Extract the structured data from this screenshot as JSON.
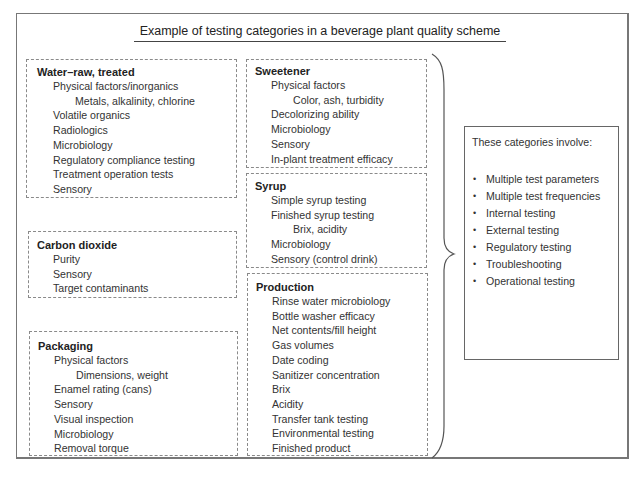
{
  "title": "Example of testing categories in a beverage plant quality scheme",
  "boxes": {
    "water": {
      "heading": "Water–raw, treated",
      "items": [
        {
          "text": "Physical factors/inorganics",
          "level": 1
        },
        {
          "text": "Metals, alkalinity, chlorine",
          "level": 2
        },
        {
          "text": "Volatile organics",
          "level": 1
        },
        {
          "text": "Radiologics",
          "level": 1
        },
        {
          "text": "Microbiology",
          "level": 1
        },
        {
          "text": "Regulatory compliance testing",
          "level": 1
        },
        {
          "text": "Treatment operation tests",
          "level": 1
        },
        {
          "text": "Sensory",
          "level": 1
        }
      ]
    },
    "carbon_dioxide": {
      "heading": "Carbon dioxide",
      "items": [
        {
          "text": "Purity",
          "level": 1
        },
        {
          "text": "Sensory",
          "level": 1
        },
        {
          "text": "Target contaminants",
          "level": 1
        }
      ]
    },
    "packaging": {
      "heading": "Packaging",
      "items": [
        {
          "text": "Physical factors",
          "level": 1
        },
        {
          "text": "Dimensions, weight",
          "level": 2
        },
        {
          "text": "Enamel rating (cans)",
          "level": 1
        },
        {
          "text": "Sensory",
          "level": 1
        },
        {
          "text": "Visual inspection",
          "level": 1
        },
        {
          "text": "Microbiology",
          "level": 1
        },
        {
          "text": "Removal torque",
          "level": 1
        }
      ]
    },
    "sweetener": {
      "heading": "Sweetener",
      "items": [
        {
          "text": "Physical factors",
          "level": 1
        },
        {
          "text": "Color, ash, turbidity",
          "level": 2
        },
        {
          "text": "Decolorizing ability",
          "level": 1
        },
        {
          "text": "Microbiology",
          "level": 1
        },
        {
          "text": "Sensory",
          "level": 1
        },
        {
          "text": "In-plant treatment efficacy",
          "level": 1
        }
      ]
    },
    "syrup": {
      "heading": "Syrup",
      "items": [
        {
          "text": "Simple syrup testing",
          "level": 1
        },
        {
          "text": "Finished syrup testing",
          "level": 1
        },
        {
          "text": "Brix, acidity",
          "level": 2
        },
        {
          "text": "Microbiology",
          "level": 1
        },
        {
          "text": "Sensory (control drink)",
          "level": 1
        }
      ]
    },
    "production": {
      "heading": "Production",
      "items": [
        {
          "text": "Rinse water microbiology",
          "level": 1
        },
        {
          "text": "Bottle washer efficacy",
          "level": 1
        },
        {
          "text": "Net contents/fill height",
          "level": 1
        },
        {
          "text": "Gas volumes",
          "level": 1
        },
        {
          "text": "Date coding",
          "level": 1
        },
        {
          "text": "Sanitizer concentration",
          "level": 1
        },
        {
          "text": "Brix",
          "level": 1
        },
        {
          "text": "Acidity",
          "level": 1
        },
        {
          "text": "Transfer tank testing",
          "level": 1
        },
        {
          "text": "Environmental testing",
          "level": 1
        },
        {
          "text": "Finished product",
          "level": 1
        }
      ]
    }
  },
  "summary": {
    "intro": "These categories involve:",
    "bullet_glyph": "•",
    "bullets": [
      "Multiple test parameters",
      "Multiple test frequencies",
      "Internal testing",
      "External testing",
      "Regulatory testing",
      "Troubleshooting",
      "Operational testing"
    ]
  }
}
